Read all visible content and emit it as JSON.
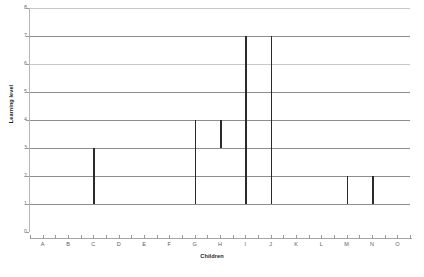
{
  "chart_data": {
    "type": "bar",
    "subtype": "floating-range-bar",
    "title": "",
    "xlabel": "Children",
    "ylabel": "Learning level",
    "categories": [
      "A",
      "B",
      "C",
      "D",
      "E",
      "F",
      "G",
      "H",
      "I",
      "J",
      "K",
      "L",
      "M",
      "N",
      "O"
    ],
    "ylim": [
      0,
      8
    ],
    "yticks": [
      0,
      1,
      2,
      3,
      4,
      5,
      6,
      7,
      8
    ],
    "grid": true,
    "legend": "none",
    "series": [
      {
        "name": "Learning level range",
        "ranges": [
          {
            "category": "A",
            "low": null,
            "high": null
          },
          {
            "category": "B",
            "low": null,
            "high": null
          },
          {
            "category": "C",
            "low": 1,
            "high": 3
          },
          {
            "category": "D",
            "low": null,
            "high": null
          },
          {
            "category": "E",
            "low": null,
            "high": null
          },
          {
            "category": "F",
            "low": null,
            "high": null
          },
          {
            "category": "G",
            "low": 1,
            "high": 4
          },
          {
            "category": "H",
            "low": 3,
            "high": 4
          },
          {
            "category": "I",
            "low": 1,
            "high": 7
          },
          {
            "category": "J",
            "low": 1,
            "high": 7
          },
          {
            "category": "K",
            "low": null,
            "high": null
          },
          {
            "category": "L",
            "low": null,
            "high": null
          },
          {
            "category": "M",
            "low": 1,
            "high": 2
          },
          {
            "category": "N",
            "low": 1,
            "high": 2
          },
          {
            "category": "O",
            "low": null,
            "high": null
          }
        ]
      }
    ],
    "colors": {
      "bar": "#2b2b2b",
      "gridline": "#8d8d8d",
      "axis": "#a5a5a5",
      "tick_label": "#5e5e5e",
      "background": "#ffffff"
    }
  }
}
